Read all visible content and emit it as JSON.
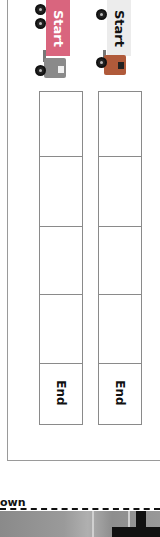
{
  "worksheet": {
    "trucks": [
      {
        "label": "Start",
        "trailer_color": "#d9657e",
        "cab_color": "#8a8a8a",
        "label_color": "#ffffff"
      },
      {
        "label": "Start",
        "trailer_color": "#ececec",
        "cab_color": "#b05a3a",
        "label_color": "#111111"
      }
    ],
    "columns": [
      {
        "cells": [
          "",
          "",
          "",
          ""
        ],
        "end_label": "End"
      },
      {
        "cells": [
          "",
          "",
          "",
          ""
        ],
        "end_label": "End"
      }
    ]
  },
  "footer": {
    "heading_fragment": "own"
  }
}
